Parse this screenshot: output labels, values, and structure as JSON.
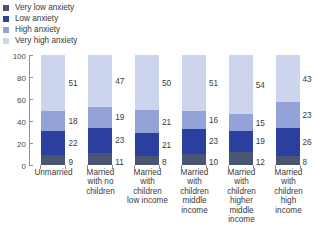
{
  "legend": {
    "position": "top-left",
    "items": [
      {
        "label": "Very low anxiety",
        "color": "#4a5573"
      },
      {
        "label": "Low anxiety",
        "color": "#2a3f9e"
      },
      {
        "label": "High anxiety",
        "color": "#93a3d8"
      },
      {
        "label": "Very high anxiety",
        "color": "#ccd4ee"
      }
    ]
  },
  "axis": {
    "y_ticks": [
      "0",
      "20",
      "40",
      "60",
      "80",
      "100"
    ]
  },
  "chart_data": {
    "type": "bar",
    "title": "",
    "xlabel": "",
    "ylabel": "",
    "ylim": [
      0,
      100
    ],
    "grid": false,
    "stacked": true,
    "legend_position": "top-left",
    "categories": [
      "Unmarried",
      "Married with no children",
      "Married with children low income",
      "Married with children middle income",
      "Married with children higher middle income",
      "Married with children high income"
    ],
    "category_lines": [
      [
        "Unmarried"
      ],
      [
        "Married",
        "with no",
        "children"
      ],
      [
        "Married",
        "with",
        "children",
        "low income"
      ],
      [
        "Married",
        "with",
        "children",
        "middle",
        "income"
      ],
      [
        "Married",
        "with",
        "children",
        "higher",
        "middle",
        "income"
      ],
      [
        "Married",
        "with",
        "children",
        "high",
        "income"
      ]
    ],
    "series": [
      {
        "name": "Very low anxiety",
        "color": "#4a5573",
        "values": [
          9,
          11,
          8,
          10,
          12,
          8
        ]
      },
      {
        "name": "Low anxiety",
        "color": "#2a3f9e",
        "values": [
          22,
          23,
          21,
          23,
          19,
          26
        ]
      },
      {
        "name": "High anxiety",
        "color": "#93a3d8",
        "values": [
          18,
          19,
          21,
          16,
          15,
          23
        ]
      },
      {
        "name": "Very high anxiety",
        "color": "#ccd4ee",
        "values": [
          51,
          47,
          50,
          51,
          54,
          43
        ]
      }
    ]
  }
}
